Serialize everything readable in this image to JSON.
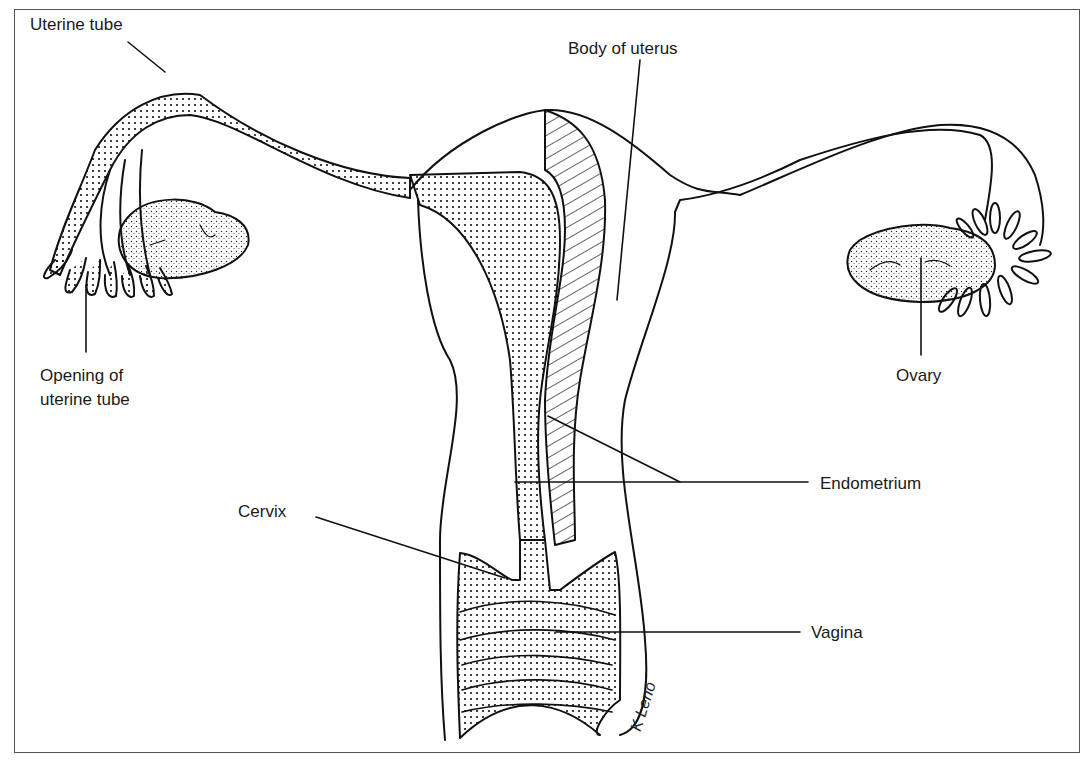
{
  "diagram": {
    "labels": {
      "uterine_tube": "Uterine tube",
      "body_of_uterus": "Body of uterus",
      "opening_line1": "Opening of",
      "opening_line2": "uterine tube",
      "ovary": "Ovary",
      "endometrium": "Endometrium",
      "cervix": "Cervix",
      "vagina": "Vagina"
    },
    "signature": "K Leno",
    "colors": {
      "line": "#111111",
      "background": "#ffffff",
      "frame": "#555555"
    }
  }
}
